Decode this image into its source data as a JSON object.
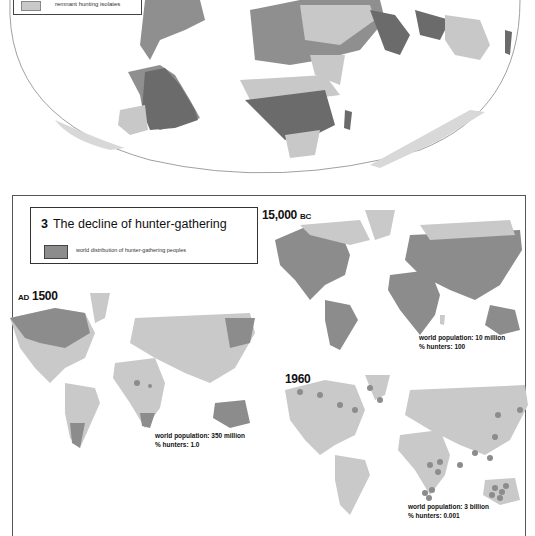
{
  "top_map": {
    "legend": {
      "label": "remnant hunting isolates",
      "swatch_color": "#c8c8c8"
    },
    "shades": {
      "dark": "#6b6b6b",
      "medium": "#8f8f8f",
      "light": "#c8c8c8"
    }
  },
  "panel": {
    "number": "3",
    "title": "The decline of hunter-gathering",
    "legend": {
      "label": "world distribution of hunter-gathering peoples",
      "swatch_color": "#8c8c8c"
    }
  },
  "maps": [
    {
      "era_main": "15,000",
      "era_suffix": "BC",
      "population": "world population: 10 million",
      "hunters": "% hunters: 100"
    },
    {
      "era_prefix": "AD",
      "era_main": "1500",
      "population": "world population: 350 million",
      "hunters": "% hunters: 1.0"
    },
    {
      "era_main": "1960",
      "population": "world population: 3 billion",
      "hunters": "% hunters: 0.001"
    }
  ],
  "colors": {
    "hunter": "#8c8c8c",
    "land": "#c9c9c9",
    "border": "#555555"
  }
}
